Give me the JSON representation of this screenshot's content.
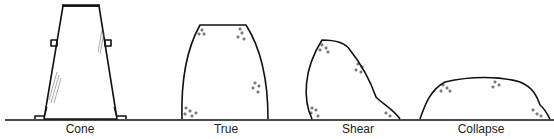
{
  "diagram": {
    "stroke_color": "#111111",
    "items": [
      {
        "id": "cone",
        "label": "Cone",
        "label_x": 80
      },
      {
        "id": "true",
        "label": "True",
        "label_x": 226
      },
      {
        "id": "shear",
        "label": "Shear",
        "label_x": 358
      },
      {
        "id": "collapse",
        "label": "Collapse",
        "label_x": 481
      }
    ]
  }
}
